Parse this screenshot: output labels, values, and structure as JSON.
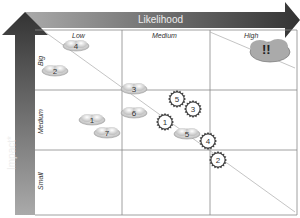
{
  "diagram": {
    "type": "risk-matrix",
    "x_axis": {
      "title": "Likelihood",
      "columns": [
        "Low",
        "Medium",
        "High"
      ]
    },
    "y_axis": {
      "title": "Impact*",
      "rows": [
        "Big",
        "Medium",
        "Small"
      ]
    },
    "high_cloud_label": "!!",
    "cloud_items": [
      {
        "label": "4",
        "x": 76,
        "y": 46
      },
      {
        "label": "2",
        "x": 55,
        "y": 71
      },
      {
        "label": "3",
        "x": 134,
        "y": 89
      },
      {
        "label": "6",
        "x": 134,
        "y": 113
      },
      {
        "label": "1",
        "x": 92,
        "y": 120
      },
      {
        "label": "7",
        "x": 107,
        "y": 133
      },
      {
        "label": "5",
        "x": 187,
        "y": 134
      }
    ],
    "gear_items": [
      {
        "label": "5",
        "x": 177,
        "y": 99
      },
      {
        "label": "3",
        "x": 193,
        "y": 109
      },
      {
        "label": "1",
        "x": 165,
        "y": 122
      },
      {
        "label": "4",
        "x": 208,
        "y": 141
      },
      {
        "label": "2",
        "x": 218,
        "y": 160
      }
    ]
  }
}
